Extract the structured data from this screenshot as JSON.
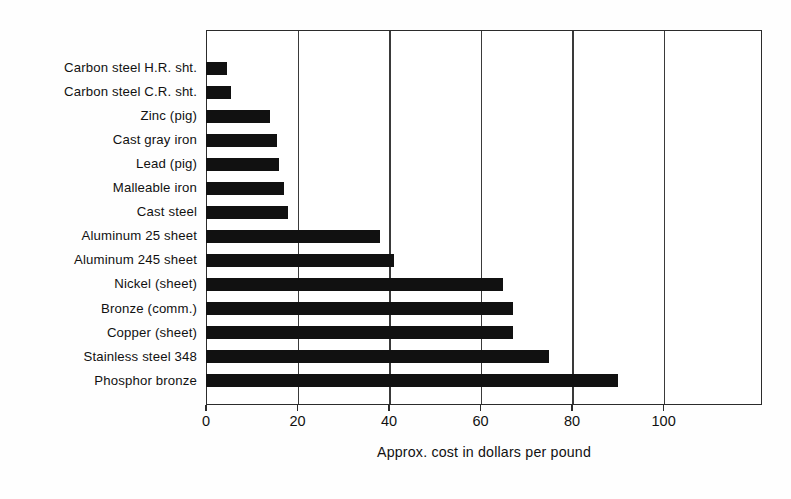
{
  "chart_data": {
    "type": "bar",
    "orientation": "horizontal",
    "title": "",
    "xlabel": "Approx. cost in dollars per pound",
    "ylabel": "",
    "xlim": [
      0,
      121.5
    ],
    "xticks": [
      0,
      20,
      40,
      60,
      80,
      100
    ],
    "xticklabels": [
      "0",
      "20",
      "40",
      "60",
      "80",
      "100"
    ],
    "gridlines": [
      20,
      40,
      60,
      80,
      100
    ],
    "grid": true,
    "legend": null,
    "bar_color": "#111111",
    "categories": [
      "Carbon steel H.R. sht.",
      "Carbon steel C.R. sht.",
      "Zinc (pig)",
      "Cast gray iron",
      "Lead (pig)",
      "Malleable iron",
      "Cast steel",
      "Aluminum 25 sheet",
      "Aluminum 245 sheet",
      "Nickel (sheet)",
      "Bronze (comm.)",
      "Copper (sheet)",
      "Stainless steel 348",
      "Phosphor bronze"
    ],
    "values": [
      4.5,
      5.5,
      14,
      15.5,
      16,
      17,
      18,
      38,
      41,
      65,
      67,
      67,
      75,
      90
    ]
  },
  "axis": {
    "x_title": "Approx. cost in dollars per pound"
  }
}
